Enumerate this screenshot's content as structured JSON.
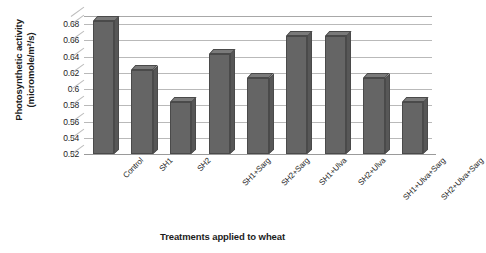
{
  "chart_data": {
    "type": "bar",
    "title": "",
    "xlabel": "Treatments applied to wheat",
    "ylabel": "Photosynthetic activity (micromole/m²/s)",
    "ylabel_line1": "Photosynthetic activity",
    "ylabel_line2": "(micromole/m²/s)",
    "categories": [
      "Control",
      "SH1",
      "SH2",
      "SH1+Sarg",
      "SH2+Sarg",
      "SH1+Ulva",
      "SH2+Ulva",
      "SH1+Ulva+Sarg",
      "SH2+Ulva+Sarg"
    ],
    "values": [
      0.684,
      0.623,
      0.584,
      0.643,
      0.614,
      0.665,
      0.665,
      0.614,
      0.584
    ],
    "ylim": [
      0.52,
      0.69
    ],
    "yticks": [
      0.52,
      0.54,
      0.56,
      0.58,
      0.6,
      0.62,
      0.64,
      0.66,
      0.68
    ],
    "ytick_labels": [
      "0.52",
      "0.54",
      "0.56",
      "0.58",
      "0.6",
      "0.62",
      "0.64",
      "0.66",
      "0.68"
    ],
    "grid": true,
    "legend": false,
    "bar_color": "#656565",
    "grid_color": "#b9b9b9",
    "style": "3d-column"
  }
}
